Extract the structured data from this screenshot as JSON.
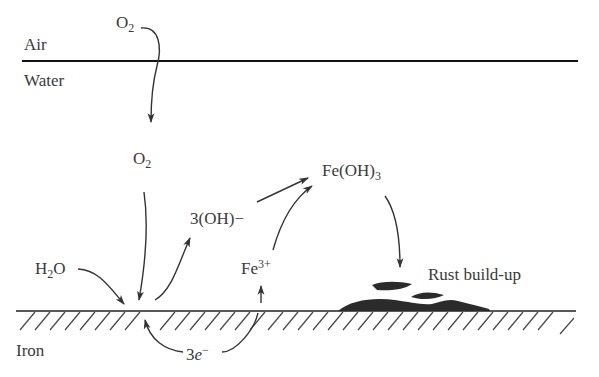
{
  "diagram": {
    "colors": {
      "ink": "#3a3a3a",
      "line": "#1a1a1a",
      "rust": "#2b2b2b",
      "background": "#ffffff"
    },
    "regions": {
      "air": "Air",
      "water": "Water",
      "iron": "Iron"
    },
    "species": {
      "o2_air": {
        "base": "O",
        "sub": "2"
      },
      "o2_water": {
        "base": "O",
        "sub": "2"
      },
      "h2o": {
        "pre": "H",
        "sub": "2",
        "post": "O"
      },
      "hydroxide": "3(OH)−",
      "iron_ion": {
        "base": "Fe",
        "sup": "3+"
      },
      "iron_hydroxide": {
        "base": "Fe(OH)",
        "sub": "3"
      },
      "electrons": {
        "coef": "3",
        "sym": "e",
        "sup": "−"
      }
    },
    "annotations": {
      "rust": "Rust build-up"
    },
    "arrows": [
      {
        "from": "O2 (air)",
        "to": "O2 (water)"
      },
      {
        "from": "O2 (water)",
        "to": "cathode site"
      },
      {
        "from": "H2O",
        "to": "cathode site"
      },
      {
        "from": "cathode site",
        "to": "3(OH)-"
      },
      {
        "from": "anode site",
        "to": "Fe3+"
      },
      {
        "from": "anode site",
        "to": "cathode site",
        "label": "3e-"
      },
      {
        "from": "3(OH)-",
        "to": "Fe(OH)3"
      },
      {
        "from": "Fe3+",
        "to": "Fe(OH)3"
      },
      {
        "from": "Fe(OH)3",
        "to": "Rust build-up"
      }
    ]
  }
}
